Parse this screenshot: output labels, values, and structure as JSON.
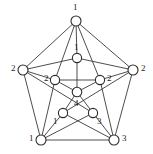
{
  "figure": {
    "kind": "graph-diagram",
    "width": 153,
    "height": 154,
    "background_color": "#ffffff",
    "stroke_color": "#3a3a3a",
    "node_fill_color": "#ffffff",
    "node_stroke_color": "#2b2b2b",
    "label_color": "#1e1e1e"
  },
  "nodes": [
    {
      "id": "outer-top",
      "label": "1",
      "cx": 76,
      "cy": 21,
      "r": 5.0,
      "label_x": 73,
      "label_y": 3,
      "label_anchor": "above"
    },
    {
      "id": "outer-left",
      "label": "2",
      "cx": 23,
      "cy": 70,
      "r": 5.0,
      "label_x": 11,
      "label_y": 64,
      "label_anchor": "left"
    },
    {
      "id": "outer-right",
      "label": "2",
      "cx": 133,
      "cy": 70,
      "r": 5.0,
      "label_x": 141,
      "label_y": 64,
      "label_anchor": "right"
    },
    {
      "id": "outer-bottom-left",
      "label": "1",
      "cx": 41,
      "cy": 140,
      "r": 5.0,
      "label_x": 29,
      "label_y": 134,
      "label_anchor": "left"
    },
    {
      "id": "outer-bottom-right",
      "label": "3",
      "cx": 114,
      "cy": 140,
      "r": 5.0,
      "label_x": 122,
      "label_y": 134,
      "label_anchor": "right"
    },
    {
      "id": "inner-top",
      "label": "1",
      "cx": 77,
      "cy": 58,
      "r": 4.6,
      "label_x": 74,
      "label_y": 43,
      "label_anchor": "above"
    },
    {
      "id": "inner-left",
      "label": "2",
      "cx": 55,
      "cy": 80,
      "r": 4.6,
      "label_x": 44,
      "label_y": 74,
      "label_anchor": "left"
    },
    {
      "id": "inner-right",
      "label": "2",
      "cx": 100,
      "cy": 80,
      "r": 4.6,
      "label_x": 107,
      "label_y": 74,
      "label_anchor": "right"
    },
    {
      "id": "inner-bottom-left",
      "label": "1",
      "cx": 63,
      "cy": 113,
      "r": 4.6,
      "label_x": 53,
      "label_y": 117,
      "label_anchor": "below-left"
    },
    {
      "id": "inner-bottom-right",
      "label": "3",
      "cx": 93,
      "cy": 113,
      "r": 4.6,
      "label_x": 97,
      "label_y": 117,
      "label_anchor": "below-right"
    },
    {
      "id": "center",
      "label": "4",
      "cx": 77,
      "cy": 92,
      "r": 4.8,
      "label_x": 74,
      "label_y": 99,
      "label_anchor": "below"
    }
  ],
  "edges": [
    {
      "from": "outer-top",
      "to": "outer-left"
    },
    {
      "from": "outer-top",
      "to": "outer-right"
    },
    {
      "from": "outer-left",
      "to": "outer-bottom-left"
    },
    {
      "from": "outer-right",
      "to": "outer-bottom-right"
    },
    {
      "from": "outer-bottom-left",
      "to": "outer-bottom-right"
    },
    {
      "from": "outer-top",
      "to": "inner-top"
    },
    {
      "from": "outer-top",
      "to": "inner-left"
    },
    {
      "from": "outer-top",
      "to": "inner-right"
    },
    {
      "from": "outer-left",
      "to": "inner-left"
    },
    {
      "from": "outer-left",
      "to": "inner-top"
    },
    {
      "from": "outer-left",
      "to": "inner-bottom-right"
    },
    {
      "from": "outer-right",
      "to": "inner-right"
    },
    {
      "from": "outer-right",
      "to": "inner-top"
    },
    {
      "from": "outer-right",
      "to": "inner-bottom-left"
    },
    {
      "from": "outer-bottom-left",
      "to": "inner-left"
    },
    {
      "from": "outer-bottom-left",
      "to": "inner-bottom-left"
    },
    {
      "from": "outer-bottom-left",
      "to": "inner-bottom-right"
    },
    {
      "from": "outer-bottom-right",
      "to": "inner-right"
    },
    {
      "from": "outer-bottom-right",
      "to": "inner-bottom-right"
    },
    {
      "from": "outer-bottom-right",
      "to": "inner-bottom-left"
    },
    {
      "from": "inner-top",
      "to": "center"
    },
    {
      "from": "inner-left",
      "to": "center"
    },
    {
      "from": "inner-right",
      "to": "center"
    },
    {
      "from": "inner-bottom-left",
      "to": "center"
    },
    {
      "from": "inner-bottom-right",
      "to": "center"
    },
    {
      "from": "inner-left",
      "to": "inner-right"
    }
  ]
}
